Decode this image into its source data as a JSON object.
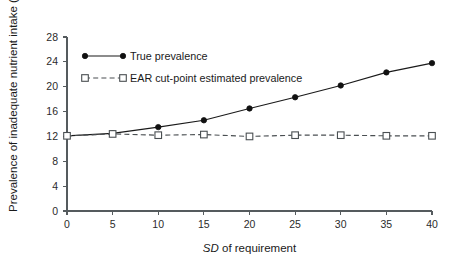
{
  "chart_data": {
    "type": "line",
    "title": "",
    "subtitle": "",
    "xlabel": "SD of requirement",
    "xlabel_italic_part": "SD",
    "xlabel_rest": " of requirement",
    "ylabel": "Prevalence of inadequate nutrient intake (%)",
    "x": [
      0,
      5,
      10,
      15,
      20,
      25,
      30,
      35,
      40
    ],
    "xlim": [
      0,
      40
    ],
    "ylim": [
      0,
      28
    ],
    "xticks": [
      "0",
      "5",
      "10",
      "15",
      "20",
      "25",
      "30",
      "35",
      "40"
    ],
    "yticks": [
      "0",
      "4",
      "8",
      "12",
      "16",
      "20",
      "24",
      "28"
    ],
    "grid": false,
    "legend_position": "upper-left-inside",
    "series": [
      {
        "name": "True prevalence",
        "marker": "filled-circle",
        "linestyle": "solid",
        "color": "#1a1a1a",
        "values": [
          12.1,
          12.5,
          13.5,
          14.6,
          16.5,
          18.3,
          20.2,
          22.3,
          23.8
        ]
      },
      {
        "name": "EAR cut-point estimated prevalence",
        "marker": "open-square",
        "linestyle": "dashed",
        "color": "#4a4f52",
        "values": [
          12.1,
          12.4,
          12.2,
          12.3,
          12.0,
          12.2,
          12.2,
          12.1,
          12.1
        ]
      }
    ]
  },
  "legend": {
    "items": [
      {
        "label": "True prevalence"
      },
      {
        "label": "EAR cut-point estimated prevalence"
      }
    ]
  },
  "colors": {
    "series_true": "#1a1a1a",
    "series_ear": "#4a4f52",
    "axis": "#555b5e",
    "background": "#ffffff"
  }
}
